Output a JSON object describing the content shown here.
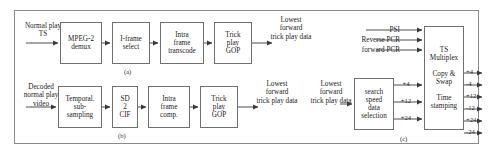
{
  "figure": {
    "caption_a": "(a)",
    "caption_b": "(b)",
    "caption_c": "(c)"
  },
  "section_a": {
    "input_label": "Normal play\nTS",
    "blocks": [
      {
        "id": "mpeg2-demux",
        "label": "MPEG-2\ndemux"
      },
      {
        "id": "i-frame-select",
        "label": "I-frame\nselect"
      },
      {
        "id": "intra-frame-transcode",
        "label": "Intra\nframe\ntranscode"
      },
      {
        "id": "trick-play-gop",
        "label": "Trick\nplay\nGOP"
      }
    ],
    "output_label": "Lowest\nforward\ntrick play data"
  },
  "section_b": {
    "input_label": "Decoded\nnormal play\nvideo",
    "blocks": [
      {
        "id": "temporal-sub-sampling",
        "label": "Temporal.\nsub-\nsampling"
      },
      {
        "id": "sd-2-cif",
        "label": "SD\n2\nCIF"
      },
      {
        "id": "intra-frame-comp",
        "label": "Intra\nframe\ncomp."
      },
      {
        "id": "trick-play-gop",
        "label": "Trick\nplay\nGOP"
      }
    ],
    "output_label": "Lowest\nforward\ntrick play data"
  },
  "section_c": {
    "input_label": "Lowest\nforward\ntrick play data",
    "search_block": {
      "id": "search-speed-data-selection",
      "label": "search\nspeed\ndata\nselection"
    },
    "mux_block": {
      "id": "ts-multiplex",
      "label": "TS\nMultiplex\n\nCopy &\nSwap\n\nTime\nstamping"
    },
    "mux_lines": [
      "TS",
      "Multiplex",
      "Copy &",
      "Swap",
      "Time",
      "stamping"
    ],
    "top_inputs": [
      "PSI",
      "Reverse PCR",
      "forward PCR"
    ],
    "mid_inputs": [
      "+4",
      "+12",
      "+24"
    ],
    "outputs": [
      "+4",
      "-4",
      "+12",
      "-12",
      "+24",
      "-24"
    ]
  },
  "colors": {
    "stroke": "#6f6f6f",
    "frame": "#8a8a8a",
    "text": "#1c1c1c",
    "background": "#ffffff"
  }
}
